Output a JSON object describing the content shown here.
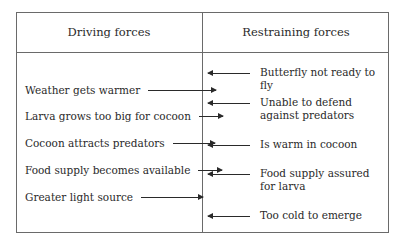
{
  "diagram": {
    "type": "force-field-analysis",
    "headers": {
      "driving": "Driving forces",
      "restraining": "Restraining forces"
    },
    "driving_forces": [
      {
        "label": "Weather gets warmer"
      },
      {
        "label": "Larva grows too big for cocoon"
      },
      {
        "label": "Cocoon attracts predators"
      },
      {
        "label": "Food supply becomes available"
      },
      {
        "label": "Greater light source"
      }
    ],
    "restraining_forces": [
      {
        "label": "Butterfly not ready to fly"
      },
      {
        "label": "Unable to defend against predators"
      },
      {
        "label": "Is warm in cocoon"
      },
      {
        "label": "Food supply assured for larva"
      },
      {
        "label": "Too cold to emerge"
      }
    ],
    "arrow_icons": {
      "driving": "arrow-right-icon",
      "restraining": "arrow-left-icon"
    }
  }
}
